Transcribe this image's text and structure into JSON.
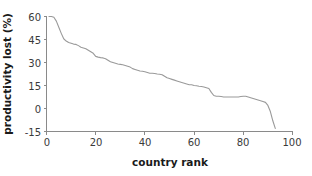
{
  "chart_data": {
    "type": "line",
    "title": "",
    "subtitle": "",
    "xlabel": "country rank",
    "ylabel": "productivity lost (%)",
    "xlim": [
      0,
      100
    ],
    "ylim": [
      -15,
      60
    ],
    "xticks": [
      0,
      20,
      40,
      60,
      80,
      100
    ],
    "xtick_labels": [
      "0",
      "20",
      "40",
      "60",
      "80",
      "100"
    ],
    "yticks": [
      -15,
      0,
      15,
      30,
      45,
      60
    ],
    "ytick_labels": [
      "-15",
      "0",
      "15",
      "30",
      "45",
      "60"
    ],
    "grid": false,
    "legend": "none",
    "line_color": "#9a9a9a",
    "axis_color": "#8a8a8a",
    "background_color": "#ffffff",
    "series": [
      {
        "name": "productivity lost",
        "x": [
          1,
          2,
          3,
          4,
          5,
          6,
          7,
          8,
          9,
          10,
          11,
          12,
          13,
          14,
          15,
          16,
          17,
          18,
          19,
          20,
          21,
          22,
          23,
          24,
          25,
          26,
          27,
          28,
          29,
          30,
          31,
          32,
          33,
          34,
          35,
          36,
          37,
          38,
          39,
          40,
          41,
          42,
          43,
          44,
          45,
          46,
          47,
          48,
          49,
          50,
          51,
          52,
          53,
          54,
          55,
          56,
          57,
          58,
          59,
          60,
          61,
          62,
          63,
          64,
          65,
          66,
          67,
          68,
          69,
          70,
          71,
          72,
          73,
          74,
          75,
          76,
          77,
          78,
          79,
          80,
          81,
          82,
          83,
          84,
          85,
          86,
          87,
          88,
          89,
          90,
          91,
          92,
          93
        ],
        "y": [
          60.0,
          60.0,
          59.5,
          57.0,
          53.0,
          49.0,
          45.5,
          44.0,
          43.0,
          42.5,
          42.0,
          41.8,
          41.0,
          40.0,
          39.5,
          39.0,
          38.0,
          37.0,
          36.0,
          34.0,
          33.5,
          33.2,
          33.0,
          32.5,
          31.5,
          30.5,
          30.0,
          29.5,
          29.0,
          28.8,
          28.5,
          28.0,
          27.5,
          27.0,
          26.0,
          25.5,
          25.0,
          24.5,
          24.3,
          24.0,
          23.5,
          23.0,
          23.0,
          22.8,
          22.5,
          22.3,
          22.0,
          21.0,
          20.0,
          19.5,
          19.0,
          18.5,
          18.0,
          17.5,
          17.0,
          16.5,
          16.0,
          15.5,
          15.5,
          15.0,
          14.8,
          14.5,
          14.3,
          14.0,
          13.5,
          13.0,
          10.5,
          8.5,
          8.0,
          8.0,
          7.8,
          7.5,
          7.5,
          7.5,
          7.5,
          7.5,
          7.5,
          7.5,
          7.8,
          8.0,
          8.0,
          7.5,
          7.0,
          6.5,
          6.0,
          5.5,
          5.0,
          4.5,
          4.0,
          2.0,
          -2.0,
          -8.0,
          -13.0
        ]
      }
    ]
  },
  "axes": {
    "y_label": "productivity lost (%)",
    "x_label": "country rank"
  }
}
